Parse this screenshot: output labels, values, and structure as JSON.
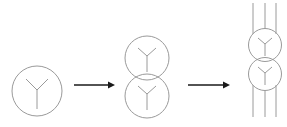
{
  "diagram": {
    "colors": {
      "background": "#ffffff",
      "shape_stroke": "#9a9a9a",
      "arrow": "#1a1a1a"
    },
    "stages": [
      {
        "name": "single-winding",
        "circles": [
          {
            "cx": 37,
            "cy": 91,
            "r": 25,
            "symbol": "Y"
          }
        ],
        "vertical_lines": []
      },
      {
        "name": "two-windings-stacked",
        "circles": [
          {
            "cx": 147,
            "cy": 58,
            "r": 22,
            "symbol": "Y"
          },
          {
            "cx": 147,
            "cy": 96,
            "r": 22,
            "symbol": "Y"
          }
        ],
        "vertical_lines": []
      },
      {
        "name": "transformer-with-lines",
        "circles": [
          {
            "cx": 265,
            "cy": 45,
            "r": 16.5,
            "symbol": "Y"
          },
          {
            "cx": 265,
            "cy": 74,
            "r": 16.5,
            "symbol": "Y"
          }
        ],
        "vertical_lines": [
          253,
          265,
          276
        ]
      }
    ],
    "arrows": [
      {
        "x1": 74,
        "x2": 115,
        "y": 85
      },
      {
        "x1": 188,
        "x2": 230,
        "y": 85
      }
    ]
  }
}
